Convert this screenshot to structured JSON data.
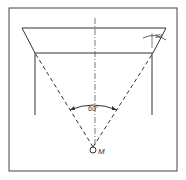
{
  "diagram": {
    "angle_label": "60°",
    "tilt_label": "30°",
    "point_label": "M",
    "line_color": "#333333",
    "background": "#ffffff"
  }
}
